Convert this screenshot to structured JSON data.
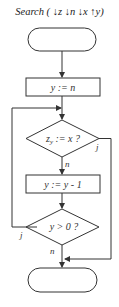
{
  "diagram": {
    "title": "Search ( ↓z ↓n ↓x ↑y)",
    "nodes": [
      {
        "id": "start",
        "type": "terminator",
        "label": ""
      },
      {
        "id": "init",
        "type": "process",
        "label": "y := n"
      },
      {
        "id": "cond1",
        "type": "decision",
        "label": "z",
        "label_sub": "y",
        "label_rest": " := x ?"
      },
      {
        "id": "decrement",
        "type": "process",
        "label": "y := y - 1"
      },
      {
        "id": "cond2",
        "type": "decision",
        "label": "y > 0 ?"
      },
      {
        "id": "end",
        "type": "terminator",
        "label": ""
      }
    ],
    "edge_labels": {
      "cond1_yes": "j",
      "cond1_no": "n",
      "cond2_yes": "j",
      "cond2_no": "n"
    },
    "colors": {
      "line": "#333333",
      "background": "#ffffff"
    }
  }
}
